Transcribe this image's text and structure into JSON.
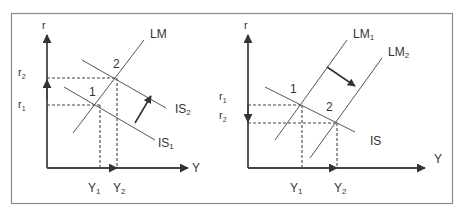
{
  "frame": {
    "border_color": "#8a8a8a",
    "line_color": "#555555",
    "axis_color": "#444444"
  },
  "left_panel": {
    "y_axis_label": "r",
    "x_axis_label": "Y",
    "r_labels": [
      {
        "base": "r",
        "sub": "2"
      },
      {
        "base": "r",
        "sub": "1"
      }
    ],
    "y_labels": [
      {
        "base": "Y",
        "sub": "1"
      },
      {
        "base": "Y",
        "sub": "2"
      }
    ],
    "curves": {
      "lm": "LM",
      "is2": {
        "base": "IS",
        "sub": "2"
      },
      "is1": {
        "base": "IS",
        "sub": "1"
      }
    },
    "points": [
      "1",
      "2"
    ]
  },
  "right_panel": {
    "y_axis_label": "r",
    "x_axis_label": "Y",
    "r_labels": [
      {
        "base": "r",
        "sub": "1"
      },
      {
        "base": "r",
        "sub": "2"
      }
    ],
    "y_labels": [
      {
        "base": "Y",
        "sub": "1"
      },
      {
        "base": "Y",
        "sub": "2"
      }
    ],
    "curves": {
      "lm1": {
        "base": "LM",
        "sub": "1"
      },
      "lm2": {
        "base": "LM",
        "sub": "2"
      },
      "is": "IS"
    },
    "points": [
      "1",
      "2"
    ]
  }
}
